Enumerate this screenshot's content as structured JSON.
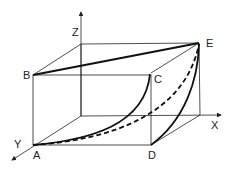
{
  "diagram": {
    "type": "3d-box-curves",
    "axes": {
      "x_label": "X",
      "y_label": "Y",
      "z_label": "Z"
    },
    "points": {
      "A": "A",
      "B": "B",
      "C": "C",
      "D": "D",
      "E": "E"
    },
    "curves": [
      {
        "name": "B-E straight line",
        "style": "solid-thick"
      },
      {
        "name": "A-C curve",
        "style": "solid-thick"
      },
      {
        "name": "A-E curve",
        "style": "dashed-thick"
      },
      {
        "name": "D-E curve",
        "style": "solid-thick"
      }
    ],
    "colors": {
      "line": "#222222",
      "background": "#ffffff"
    }
  }
}
